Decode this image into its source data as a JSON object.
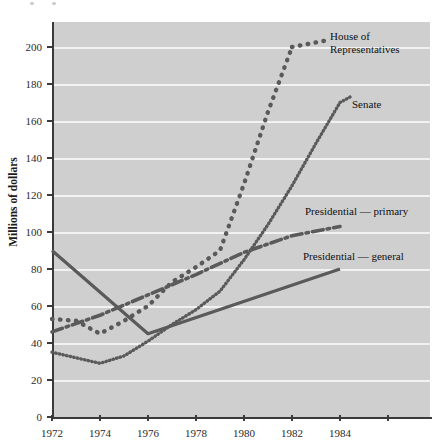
{
  "chart_data": {
    "type": "line",
    "title": "",
    "xlabel": "",
    "ylabel": "Millions of dollars",
    "xlim": [
      1972,
      1986
    ],
    "ylim": [
      0,
      210
    ],
    "xticks": [
      1972,
      1974,
      1976,
      1978,
      1980,
      1982,
      1984
    ],
    "yticks": [
      0,
      20,
      40,
      60,
      80,
      100,
      120,
      140,
      160,
      180,
      200
    ],
    "grid": "horizontal",
    "legend_position": "inline-right-of-series",
    "series": [
      {
        "name": "House of Representatives",
        "style": "dotted",
        "x": [
          1972,
          1973,
          1974,
          1975,
          1976,
          1977,
          1978,
          1979,
          1980,
          1981,
          1982
        ],
        "values": [
          53,
          52,
          45,
          52,
          60,
          73,
          81,
          90,
          126,
          165,
          200
        ]
      },
      {
        "name": "Senate",
        "style": "fine-dotted",
        "x": [
          1972,
          1973,
          1974,
          1975,
          1976,
          1977,
          1978,
          1979,
          1980,
          1981,
          1982,
          1983,
          1984
        ],
        "values": [
          35,
          32,
          29,
          33,
          41,
          50,
          58,
          68,
          85,
          104,
          125,
          148,
          170
        ]
      },
      {
        "name": "Presidential — primary",
        "style": "dash-dot",
        "x": [
          1972,
          1974,
          1976,
          1978,
          1980,
          1982,
          1984
        ],
        "values": [
          46,
          55,
          66,
          77,
          89,
          98,
          103
        ]
      },
      {
        "name": "Presidential — general",
        "style": "solid",
        "x": [
          1972,
          1976,
          1984
        ],
        "values": [
          90,
          45,
          80
        ]
      }
    ],
    "annotations": [
      {
        "text": "House of Representatives",
        "near_year": 1983,
        "near_value": 203
      },
      {
        "text": "Senate",
        "near_year": 1984.4,
        "near_value": 171
      },
      {
        "text": "Presidential — primary",
        "near_year": 1982,
        "near_value": 112
      },
      {
        "text": "Presidential — general",
        "near_year": 1982,
        "near_value": 86
      }
    ]
  },
  "labels": {
    "ylabel": "Millions of dollars",
    "yticks": [
      "0",
      "20",
      "40",
      "60",
      "80",
      "100",
      "120",
      "140",
      "160",
      "180",
      "200"
    ],
    "xticks": [
      "1972",
      "1974",
      "1976",
      "1978",
      "1980",
      "1982",
      "1984"
    ],
    "series_house": "House of Representatives",
    "series_house_line1": "House of",
    "series_house_line2": "Representatives",
    "series_senate": "Senate",
    "series_pres_primary": "Presidential — primary",
    "series_pres_general": "Presidential — general"
  },
  "colors": {
    "plot_background": "#cfcfcf",
    "gridline": "#f2f2f2",
    "series_line": "#5a5a5a",
    "axis": "#3a3a3a",
    "text": "#1c1c1c"
  }
}
